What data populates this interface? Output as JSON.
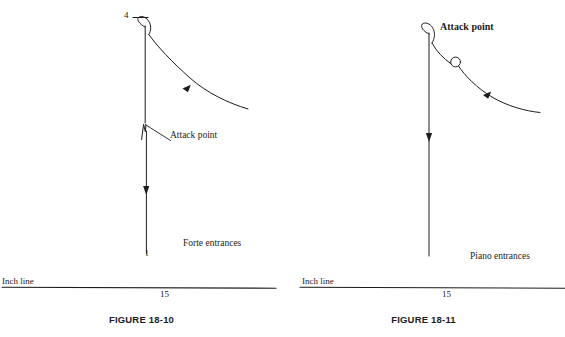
{
  "document": {
    "type": "textbook-figure-pair",
    "background_color": "#ffffff",
    "ink_color": "#1c1c1c"
  },
  "figures": [
    {
      "id": "figure-18-10",
      "caption": "FIGURE 18-10",
      "top_number": "4",
      "bottom_number": "1",
      "attack_point_label": "Attack point",
      "attack_point_label_bold": false,
      "entrance_label": "Forte entrances",
      "inch_line_label": "Inch line",
      "inch_measure": "15"
    },
    {
      "id": "figure-18-11",
      "caption": "FIGURE 18-11",
      "top_number": "",
      "bottom_number": "",
      "attack_point_label": "Attack point",
      "attack_point_label_bold": true,
      "entrance_label": "Piano entrances",
      "inch_line_label": "Inch line",
      "inch_measure": "15"
    }
  ]
}
